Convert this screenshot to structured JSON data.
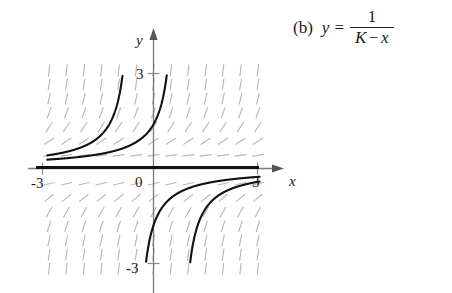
{
  "equation": {
    "item_label": "(b)",
    "lhs": "y",
    "relation": "=",
    "numerator": "1",
    "denominator_left": "K",
    "denominator_op": "−",
    "denominator_right": "x",
    "plain": "(b) y = 1/(K − x)"
  },
  "chart_data": {
    "type": "line",
    "title": "",
    "subtitle": "",
    "xlabel": "x",
    "ylabel": "y",
    "xlim": [
      -3.2,
      3.2
    ],
    "ylim": [
      -3.4,
      3.4
    ],
    "xticks": [
      -3,
      3
    ],
    "yticks": [
      -3,
      3
    ],
    "xtick_labels": [
      "-3",
      "3"
    ],
    "ytick_labels": [
      "3",
      "-3"
    ],
    "origin_label": "0",
    "grid": false,
    "legend": null,
    "axis_color": "#7a7a7a",
    "curve_color": "#111111",
    "slopefield_color": "#b9b9b9",
    "slope_field": {
      "equation": "dy/dx = y^2",
      "description": "short dashed line segments with slope y squared",
      "x_start": -3.0,
      "x_end": 3.0,
      "x_step": 0.5,
      "y_start": -3.2,
      "y_end": 3.2,
      "y_step": 0.45,
      "segment_length": 11
    },
    "series": [
      {
        "name": "y = 1/(K - x), K = -0.55",
        "K": -0.55,
        "branch": "upper-left",
        "note": "rises steeply to +3 near x = -0.55"
      },
      {
        "name": "y = 1/(K - x), K = 0.72",
        "K": 0.72,
        "branch": "upper-right",
        "note": "rises steeply to +3 near x = 0.72"
      },
      {
        "name": "y = 1/(K - x), K = -0.55 (lower branch)",
        "K": -0.55,
        "branch": "lower-left",
        "note": "falls from near 0 to -3 approaching x = -0.55 from the right"
      },
      {
        "name": "y = 1/(K - x), K = 0.72 (lower branch)",
        "K": 0.72,
        "branch": "lower-right",
        "note": "falls from near 0 to -3 approaching x = 0.72 from the right"
      },
      {
        "name": "y = 0 (equilibrium solution, K infinite)",
        "K": null,
        "branch": "horizontal",
        "note": "bold horizontal line along the x-axis from -3 to 3"
      }
    ]
  }
}
